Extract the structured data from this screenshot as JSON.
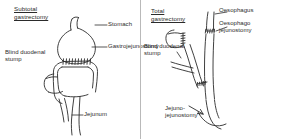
{
  "figure": {
    "kind": "medical-line-diagram",
    "ink_color": "#2b2b2b",
    "background_color": "#ffffff",
    "divider_color": "#b9b9b9"
  },
  "panels": [
    {
      "id": "subtotal-gastrectomy",
      "title": "Subtotal\ngastrectomy",
      "labels": [
        {
          "name": "stomach",
          "text": "Stomach"
        },
        {
          "name": "gastrojejunostomy",
          "text": "Gastrojejunostomy"
        },
        {
          "name": "blind-duodenal-stump",
          "text": "Blind duodenal\nstump"
        },
        {
          "name": "jejunum",
          "text": "Jejunum"
        }
      ]
    },
    {
      "id": "total-gastrectomy",
      "title": "Total\ngastrectomy",
      "labels": [
        {
          "name": "oesophagus",
          "text": "Oesophagus"
        },
        {
          "name": "oesophago-jejunostomy",
          "text": "Oesophago\njejunostomy"
        },
        {
          "name": "blind-duodenal-stump",
          "text": "Blind duodenal\nstump"
        },
        {
          "name": "jejuno-jejunostomy",
          "text": "Jejuno-\njejunostomy"
        }
      ]
    }
  ]
}
